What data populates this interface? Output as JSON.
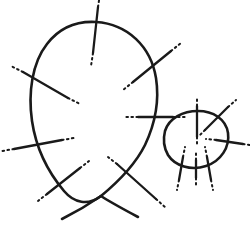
{
  "figure": {
    "type": "line-diagram",
    "canvas": {
      "width": 250,
      "height": 237,
      "background": "#ffffff"
    },
    "style": {
      "curve_color": "#1a1a1a",
      "curve_width": 2.6,
      "tick_color": "#1a1a1a",
      "tick_width": 2.3,
      "dot_color": "#1a1a1a",
      "dot_width": 2.0,
      "dot_dash_pattern": "1.6 3.4"
    },
    "components": {
      "large_oval_label": "large closed oval",
      "small_loop_label": "small closed loop",
      "crossing_count": 2,
      "tick_count": 13,
      "free_tail_count": 2
    },
    "paths": {
      "large_oval": "M 96 22 C 128 24 151 47 156 78 C 160 104 154 126 145 145 C 136 163 118 182 101 196 C 88 206 74 203 64 191 C 48 172 36 148 32 121 C 28 93 32 63 47 44 C 60 27 78 21 96 22 Z",
      "small_loop": "M 165 131 C 169 118 183 111 198 111 C 213 111 226 119 228 133 C 230 147 221 161 206 166 C 191 171 175 166 168 155 C 164 148 163 139 165 131 Z",
      "tail_left": "M 62 219 C 74 213 88 205 101 196",
      "tail_right": "M 138 217 C 123 209 110 202 101 196",
      "tail_upper_right": "M 156 78 C 156 98 152 116 145 145"
    },
    "ticks": [
      {
        "name": "tick-oval-top",
        "solid": "M 98 7 L 93 53",
        "dots": [
          "M 98 7 L 100 -6",
          "M 93 53 L 91 66"
        ]
      },
      {
        "name": "tick-oval-upper-left",
        "solid": "M 23 72 L 68 98",
        "dots": [
          "M 23 72 L 11 66",
          "M 68 98 L 80 104"
        ]
      },
      {
        "name": "tick-oval-upper-right",
        "solid": "M 171 51 L 133 82",
        "dots": [
          "M 171 51 L 181 43",
          "M 133 82 L 123 90"
        ]
      },
      {
        "name": "tick-oval-left",
        "solid": "M 14 149 L 62 140",
        "dots": [
          "M 14 149 L 2 151",
          "M 62 140 L 74 138"
        ]
      },
      {
        "name": "tick-oval-lower-left",
        "solid": "M 47 194 L 80 168",
        "dots": [
          "M 47 194 L 38 201",
          "M 80 168 L 89 161"
        ]
      },
      {
        "name": "tick-oval-lower-mid",
        "solid": "M 117 164 L 156 199",
        "dots": [
          "M 117 164 L 108 157",
          "M 156 199 L 165 207"
        ]
      },
      {
        "name": "tick-strand-right",
        "solid": "M 138 117 L 173 117",
        "dots": [
          "M 138 117 L 126 117",
          "M 173 117 L 186 117"
        ]
      },
      {
        "name": "tick-loop-top",
        "solid": "M 197 106 L 197 137",
        "dots": [
          "M 197 106 L 197 96",
          "M 197 137 L 197 147"
        ]
      },
      {
        "name": "tick-loop-upper-right",
        "solid": "M 228 107 L 205 130",
        "dots": [
          "M 228 107 L 236 100",
          "M 205 130 L 198 137"
        ]
      },
      {
        "name": "tick-loop-right",
        "solid": "M 216 140 L 243 144",
        "dots": [
          "M 216 140 L 206 139",
          "M 243 144 L 250 145"
        ]
      },
      {
        "name": "tick-loop-bottom-left",
        "solid": "M 183 157 L 179 180",
        "dots": [
          "M 183 157 L 185 147",
          "M 179 180 L 177 190"
        ]
      },
      {
        "name": "tick-loop-bottom-right",
        "solid": "M 207 157 L 211 180",
        "dots": [
          "M 207 157 L 205 147",
          "M 211 180 L 213 190"
        ]
      },
      {
        "name": "tick-loop-bottom-mid",
        "solid": "M 196 160 L 196 178",
        "dots": [
          "M 196 160 L 196 151",
          "M 196 178 L 196 188"
        ]
      }
    ],
    "crossings": [
      {
        "name": "crossing-bottom",
        "x": 101,
        "y": 196
      },
      {
        "name": "crossing-right",
        "x": 158,
        "y": 133
      }
    ]
  }
}
